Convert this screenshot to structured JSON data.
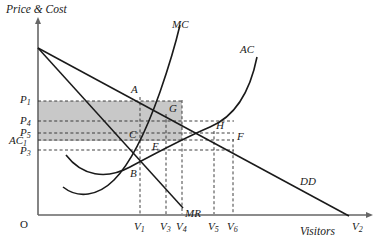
{
  "figure": {
    "yaxis_title": "Price & Cost",
    "xaxis_title": "Visitors",
    "origin_label": "O"
  },
  "curve_labels": {
    "mc": "MC",
    "ac": "AC",
    "dd": "DD",
    "mr": "MR"
  },
  "point_labels": {
    "a": "A",
    "b": "B",
    "c": "C",
    "e": "E",
    "f": "F",
    "g": "G",
    "h": "H"
  },
  "price_axis_labels": [
    {
      "id": "p1",
      "base": "P",
      "sub": "1",
      "y": 100
    },
    {
      "id": "p4",
      "base": "P",
      "sub": "4",
      "y": 121
    },
    {
      "id": "p5",
      "base": "P",
      "sub": "5",
      "y": 133
    },
    {
      "id": "ac1",
      "base": "AC",
      "sub": "1",
      "y": 141
    },
    {
      "id": "p3",
      "base": "P",
      "sub": "3",
      "y": 151
    }
  ],
  "visitor_axis_labels": [
    {
      "id": "v1",
      "base": "V",
      "sub": "1",
      "x": 140
    },
    {
      "id": "v3",
      "base": "V",
      "sub": "3",
      "x": 166
    },
    {
      "id": "v4",
      "base": "V",
      "sub": "4",
      "x": 182
    },
    {
      "id": "v5",
      "base": "V",
      "sub": "5",
      "x": 214
    },
    {
      "id": "v6",
      "base": "V",
      "sub": "6",
      "x": 233
    },
    {
      "id": "v2",
      "base": "V",
      "sub": "2",
      "x": 358
    }
  ],
  "colors": {
    "line": "#1a1a1a",
    "axis": "#555555",
    "shaded_region": "#c8c8c8",
    "dashed": "#333333",
    "background": "#ffffff"
  },
  "chart_data": {
    "type": "line",
    "title": "",
    "xlabel": "Visitors",
    "ylabel": "Price & Cost",
    "axes": {
      "origin_px": {
        "x": 38,
        "y": 215
      },
      "y_top_px": 18,
      "x_right_px": 372
    },
    "series": [
      {
        "name": "DD",
        "label": "DD",
        "type": "line-straight",
        "points_px": [
          {
            "x": 38,
            "y": 48
          },
          {
            "x": 348,
            "y": 215
          }
        ],
        "label_px": {
          "x": 303,
          "y": 182
        }
      },
      {
        "name": "MR",
        "label": "MR",
        "type": "line-straight",
        "points_px": [
          {
            "x": 38,
            "y": 48
          },
          {
            "x": 182,
            "y": 207
          }
        ],
        "label_px": {
          "x": 186,
          "y": 214
        }
      },
      {
        "name": "MC",
        "label": "MC",
        "type": "curve-u",
        "path_px": "M 64,186 C 80,198 98,196 116,178 C 134,160 150,120 162,86 C 170,62 176,40 179,24",
        "label_px": {
          "x": 178,
          "y": 30
        }
      },
      {
        "name": "AC",
        "label": "AC",
        "type": "curve-u",
        "path_px": "M 66,156 C 84,178 108,180 132,166 C 158,152 186,136 214,124 C 236,114 250,92 256,58",
        "label_px": {
          "x": 246,
          "y": 55
        }
      }
    ],
    "marked_points": [
      {
        "label": "A",
        "x_px": 140,
        "y_px": 97,
        "note": "on DD at V1"
      },
      {
        "label": "G",
        "x_px": 166,
        "y_px": 114,
        "note": "DD meets MC"
      },
      {
        "label": "H",
        "x_px": 214,
        "y_px": 131,
        "note": "DD meets AC"
      },
      {
        "label": "F",
        "x_px": 233,
        "y_px": 139,
        "note": "on DD at V6"
      },
      {
        "label": "C",
        "x_px": 140,
        "y_px": 136,
        "note": "on AC at V1"
      },
      {
        "label": "E",
        "x_px": 166,
        "y_px": 146,
        "note": "on AC at V3"
      },
      {
        "label": "B",
        "x_px": 140,
        "y_px": 173,
        "note": "MR meets MC"
      }
    ],
    "horizontal_guides_px": [
      {
        "id": "p1",
        "y": 100,
        "x_from": 38,
        "x_to": 182
      },
      {
        "id": "p4",
        "y": 121,
        "x_from": 38,
        "x_to": 233
      },
      {
        "id": "p5",
        "y": 133,
        "x_from": 38,
        "x_to": 233
      },
      {
        "id": "ac1",
        "y": 140,
        "x_from": 38,
        "x_to": 233
      },
      {
        "id": "p3",
        "y": 150,
        "x_from": 38,
        "x_to": 233
      }
    ],
    "vertical_guides_px": [
      {
        "id": "v1",
        "x": 140,
        "y_from": 97,
        "y_to": 215
      },
      {
        "id": "v3",
        "x": 166,
        "y_from": 114,
        "y_to": 215
      },
      {
        "id": "v4",
        "x": 182,
        "y_from": 100,
        "y_to": 215
      },
      {
        "id": "v5",
        "x": 214,
        "y_from": 131,
        "y_to": 215
      },
      {
        "id": "v6",
        "x": 233,
        "y_from": 139,
        "y_to": 215
      }
    ],
    "shaded_rect_px": {
      "x": 38,
      "y": 101,
      "width": 144,
      "height": 40
    },
    "legend": "none",
    "grid": false
  }
}
